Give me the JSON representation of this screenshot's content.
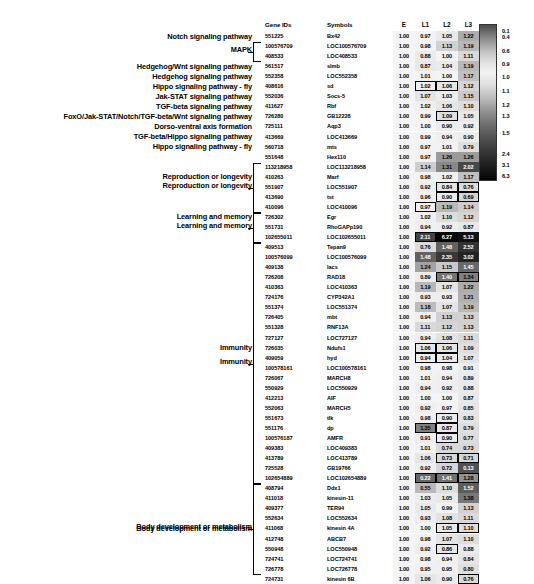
{
  "figure": {
    "type": "heatmap-table",
    "columns": [
      "Gene IDs",
      "Symbols",
      "E",
      "L1",
      "L2",
      "L3"
    ],
    "header": {
      "gene_ids": "Gene IDs",
      "symbols": "Symbols",
      "e": "E",
      "l1": "L1",
      "l2": "L2",
      "l3": "L3"
    }
  },
  "legend": {
    "name": "expression-color-scale",
    "labels": [
      "0.1",
      "0.4",
      "0.6",
      "0.9",
      "1.0",
      "1.1",
      "1.2",
      "1.3",
      "1.5",
      "2.4",
      "3.1",
      "6.3"
    ],
    "min": "0.1",
    "max": "6.3"
  },
  "groups": [
    {
      "label": "Reproduction or longevity",
      "start": 13,
      "end": 17
    },
    {
      "label": "Learning and memory",
      "start": 18,
      "end": 20
    },
    {
      "label": "Immunity",
      "start": 21,
      "end": 44
    },
    {
      "label": "Body development or metabolism",
      "start": 45,
      "end": 53
    },
    {
      "label": "MAPK",
      "start": 1,
      "end": 2
    }
  ],
  "rows": [
    {
      "annot": "Notch signaling pathway",
      "gene_id": "551225",
      "symbol": "Bx42",
      "e": "1.00",
      "l1": "0.97",
      "l2": "1.05",
      "l3": "1.22",
      "box": []
    },
    {
      "annot": "",
      "gene_id": "100576709",
      "symbol": "LOC100576709",
      "e": "1.00",
      "l1": "0.98",
      "l2": "1.13",
      "l3": "1.19",
      "box": []
    },
    {
      "annot": "",
      "gene_id": "408533",
      "symbol": "LOC408533",
      "e": "1.00",
      "l1": "0.88",
      "l2": "1.00",
      "l3": "1.11",
      "box": []
    },
    {
      "annot": "Hedgehog/Wnt signaling pathway",
      "gene_id": "561517",
      "symbol": "slmb",
      "e": "1.00",
      "l1": "0.87",
      "l2": "1.04",
      "l3": "1.19",
      "box": []
    },
    {
      "annot": "Hedgehog signaling pathway",
      "gene_id": "552358",
      "symbol": "LOC552358",
      "e": "1.00",
      "l1": "1.01",
      "l2": "1.00",
      "l3": "1.17",
      "box": []
    },
    {
      "annot": "Hippo signaling pathway - fly",
      "gene_id": "408616",
      "symbol": "sd",
      "e": "1.00",
      "l1": "1.02",
      "l2": "1.06",
      "l3": "1.12",
      "box": [
        "l1",
        "l2"
      ]
    },
    {
      "annot": "Jak-STAT signaling pathway",
      "gene_id": "552036",
      "symbol": "Socs-5",
      "e": "1.00",
      "l1": "1.07",
      "l2": "1.03",
      "l3": "1.15",
      "box": []
    },
    {
      "annot": "TGF-beta signaling pathway",
      "gene_id": "411627",
      "symbol": "Rbf",
      "e": "1.00",
      "l1": "1.02",
      "l2": "1.06",
      "l3": "1.10",
      "box": []
    },
    {
      "annot": "FoxO/Jak-STAT/Notch/TGF-beta/Wnt signaling pathway",
      "gene_id": "726280",
      "symbol": "GB12228",
      "e": "1.00",
      "l1": "0.99",
      "l2": "1.09",
      "l3": "1.05",
      "box": [
        "l2"
      ]
    },
    {
      "annot": "Dorso-ventral axis formation",
      "gene_id": "725111",
      "symbol": "Aqp3",
      "e": "1.00",
      "l1": "1.00",
      "l2": "0.90",
      "l3": "0.92",
      "box": []
    },
    {
      "annot": "TGF-beta/Hippo signaling pathway",
      "gene_id": "413669",
      "symbol": "LOC413669",
      "e": "1.00",
      "l1": "0.99",
      "l2": "0.94",
      "l3": "0.90",
      "box": []
    },
    {
      "annot": "Hippo signaling pathway - fly",
      "gene_id": "560718",
      "symbol": "mts",
      "e": "1.00",
      "l1": "0.97",
      "l2": "1.01",
      "l3": "0.79",
      "box": []
    },
    {
      "annot": "",
      "gene_id": "551648",
      "symbol": "Hex110",
      "e": "1.00",
      "l1": "0.97",
      "l2": "1.26",
      "l3": "1.26",
      "box": []
    },
    {
      "annot": "",
      "gene_id": "113218958",
      "symbol": "LOC113218958",
      "e": "1.00",
      "l1": "1.14",
      "l2": "1.31",
      "l3": "2.02",
      "box": []
    },
    {
      "annot": "Reproduction or longevity",
      "gene_id": "410263",
      "symbol": "Marf",
      "e": "1.00",
      "l1": "0.98",
      "l2": "1.02",
      "l3": "1.17",
      "box": []
    },
    {
      "annot": "",
      "gene_id": "551907",
      "symbol": "LOC551907",
      "e": "1.00",
      "l1": "0.92",
      "l2": "0.84",
      "l3": "0.76",
      "box": [
        "l2",
        "l3"
      ]
    },
    {
      "annot": "",
      "gene_id": "413690",
      "symbol": "tst",
      "e": "1.00",
      "l1": "0.96",
      "l2": "0.90",
      "l3": "0.69",
      "box": [
        "l2",
        "l3"
      ]
    },
    {
      "annot": "",
      "gene_id": "410096",
      "symbol": "LOC410096",
      "e": "1.00",
      "l1": "0.97",
      "l2": "1.19",
      "l3": "1.14",
      "box": [
        "l1"
      ]
    },
    {
      "annot": "Learning and memory",
      "gene_id": "726302",
      "symbol": "Egr",
      "e": "1.00",
      "l1": "1.02",
      "l2": "1.10",
      "l3": "1.12",
      "box": []
    },
    {
      "annot": "",
      "gene_id": "551731",
      "symbol": "RhoGAPp190",
      "e": "1.00",
      "l1": "0.94",
      "l2": "0.92",
      "l3": "0.87",
      "box": []
    },
    {
      "annot": "",
      "gene_id": "102655011",
      "symbol": "LOC102655011",
      "e": "1.00",
      "l1": "2.11",
      "l2": "6.27",
      "l3": "5.13",
      "box": [
        "l1"
      ]
    },
    {
      "annot": "",
      "gene_id": "409513",
      "symbol": "Tepan9",
      "e": "1.00",
      "l1": "0.76",
      "l2": "1.48",
      "l3": "2.52",
      "box": []
    },
    {
      "annot": "",
      "gene_id": "100576099",
      "symbol": "LOC100576099",
      "e": "1.00",
      "l1": "1.48",
      "l2": "2.35",
      "l3": "3.02",
      "box": []
    },
    {
      "annot": "",
      "gene_id": "409138",
      "symbol": "lacs",
      "e": "1.00",
      "l1": "1.24",
      "l2": "1.15",
      "l3": "1.45",
      "box": []
    },
    {
      "annot": "",
      "gene_id": "726208",
      "symbol": "RAD18",
      "e": "1.00",
      "l1": "0.89",
      "l2": "1.40",
      "l3": "1.34",
      "box": [
        "l2",
        "l3"
      ]
    },
    {
      "annot": "",
      "gene_id": "410363",
      "symbol": "LOC410363",
      "e": "1.00",
      "l1": "1.19",
      "l2": "1.07",
      "l3": "1.22",
      "box": []
    },
    {
      "annot": "",
      "gene_id": "724176",
      "symbol": "CYP342A1",
      "e": "1.00",
      "l1": "0.93",
      "l2": "0.93",
      "l3": "1.21",
      "box": []
    },
    {
      "annot": "",
      "gene_id": "551374",
      "symbol": "LOC551374",
      "e": "1.00",
      "l1": "1.18",
      "l2": "1.07",
      "l3": "1.19",
      "box": []
    },
    {
      "annot": "",
      "gene_id": "726405",
      "symbol": "mbt",
      "e": "1.00",
      "l1": "0.94",
      "l2": "1.13",
      "l3": "1.13",
      "box": []
    },
    {
      "annot": "",
      "gene_id": "551328",
      "symbol": "RNF13A",
      "e": "1.00",
      "l1": "1.11",
      "l2": "1.12",
      "l3": "1.13",
      "box": []
    },
    {
      "annot": "",
      "gene_id": "727127",
      "symbol": "LOC727127",
      "e": "1.00",
      "l1": "0.94",
      "l2": "1.08",
      "l3": "1.11",
      "box": []
    },
    {
      "annot": "Immunity",
      "gene_id": "726035",
      "symbol": "Ndufs1",
      "e": "1.00",
      "l1": "1.06",
      "l2": "1.06",
      "l3": "1.09",
      "box": [
        "l1",
        "l2"
      ]
    },
    {
      "annot": "",
      "gene_id": "409059",
      "symbol": "hyd",
      "e": "1.00",
      "l1": "0.94",
      "l2": "1.04",
      "l3": "1.07",
      "box": [
        "l1",
        "l2"
      ]
    },
    {
      "annot": "",
      "gene_id": "100578161",
      "symbol": "LOC100578161",
      "e": "1.00",
      "l1": "0.98",
      "l2": "0.98",
      "l3": "0.91",
      "box": []
    },
    {
      "annot": "",
      "gene_id": "726067",
      "symbol": "MARCH8",
      "e": "1.00",
      "l1": "1.01",
      "l2": "0.94",
      "l3": "0.89",
      "box": []
    },
    {
      "annot": "",
      "gene_id": "550929",
      "symbol": "LOC550929",
      "e": "1.00",
      "l1": "0.94",
      "l2": "0.92",
      "l3": "0.88",
      "box": []
    },
    {
      "annot": "",
      "gene_id": "412213",
      "symbol": "AIF",
      "e": "1.00",
      "l1": "1.00",
      "l2": "1.00",
      "l3": "0.87",
      "box": []
    },
    {
      "annot": "",
      "gene_id": "552063",
      "symbol": "MARCH5",
      "e": "1.00",
      "l1": "0.92",
      "l2": "0.97",
      "l3": "0.85",
      "box": []
    },
    {
      "annot": "",
      "gene_id": "551673",
      "symbol": "tlk",
      "e": "1.00",
      "l1": "0.98",
      "l2": "0.90",
      "l3": "0.83",
      "box": [
        "l2"
      ]
    },
    {
      "annot": "",
      "gene_id": "551176",
      "symbol": "dp",
      "e": "1.00",
      "l1": "1.35",
      "l2": "0.87",
      "l3": "0.79",
      "box": [
        "l1",
        "l2"
      ]
    },
    {
      "annot": "",
      "gene_id": "100576187",
      "symbol": "AMFR",
      "e": "1.00",
      "l1": "0.91",
      "l2": "0.90",
      "l3": "0.77",
      "box": [
        "l2"
      ]
    },
    {
      "annot": "",
      "gene_id": "409383",
      "symbol": "LOC409383",
      "e": "1.00",
      "l1": "1.01",
      "l2": "0.74",
      "l3": "0.73",
      "box": []
    },
    {
      "annot": "",
      "gene_id": "413789",
      "symbol": "LOC413789",
      "e": "1.00",
      "l1": "1.06",
      "l2": "0.73",
      "l3": "0.71",
      "box": [
        "l2",
        "l3"
      ]
    },
    {
      "annot": "",
      "gene_id": "725528",
      "symbol": "GB19766",
      "e": "1.00",
      "l1": "0.92",
      "l2": "0.72",
      "l3": "0.13",
      "box": []
    },
    {
      "annot": "",
      "gene_id": "102654889",
      "symbol": "LOC102654889",
      "e": "1.00",
      "l1": "0.22",
      "l2": "1.41",
      "l3": "1.28",
      "box": [
        "l1",
        "l2",
        "l3"
      ]
    },
    {
      "annot": "",
      "gene_id": "408794",
      "symbol": "Ddx1",
      "e": "1.00",
      "l1": "0.55",
      "l2": "1.10",
      "l3": "1.52",
      "box": []
    },
    {
      "annot": "",
      "gene_id": "411018",
      "symbol": "kinesin-11",
      "e": "1.00",
      "l1": "1.03",
      "l2": "1.05",
      "l3": "1.38",
      "box": []
    },
    {
      "annot": "",
      "gene_id": "409377",
      "symbol": "TER94",
      "e": "1.00",
      "l1": "1.05",
      "l2": "0.99",
      "l3": "1.13",
      "box": []
    },
    {
      "annot": "",
      "gene_id": "552634",
      "symbol": "LOC552634",
      "e": "1.00",
      "l1": "0.93",
      "l2": "1.08",
      "l3": "1.11",
      "box": []
    },
    {
      "annot": "Body development or metabolism",
      "gene_id": "411068",
      "symbol": "kinesin 4A",
      "e": "1.00",
      "l1": "1.00",
      "l2": "1.05",
      "l3": "1.10",
      "box": [
        "l2",
        "l3"
      ]
    },
    {
      "annot": "",
      "gene_id": "412748",
      "symbol": "ABCB7",
      "e": "1.00",
      "l1": "0.98",
      "l2": "1.07",
      "l3": "1.10",
      "box": []
    },
    {
      "annot": "",
      "gene_id": "550948",
      "symbol": "LOC550948",
      "e": "1.00",
      "l1": "0.92",
      "l2": "0.86",
      "l3": "0.88",
      "box": [
        "l2"
      ]
    },
    {
      "annot": "",
      "gene_id": "724741",
      "symbol": "LOC724741",
      "e": "1.00",
      "l1": "0.98",
      "l2": "0.94",
      "l3": "0.84",
      "box": []
    },
    {
      "annot": "",
      "gene_id": "726778",
      "symbol": "LOC726778",
      "e": "1.00",
      "l1": "0.95",
      "l2": "0.95",
      "l3": "0.80",
      "box": []
    },
    {
      "annot": "",
      "gene_id": "724731",
      "symbol": "kinesin 6B",
      "e": "1.00",
      "l1": "1.06",
      "l2": "0.90",
      "l3": "0.76",
      "box": [
        "l3"
      ]
    }
  ]
}
